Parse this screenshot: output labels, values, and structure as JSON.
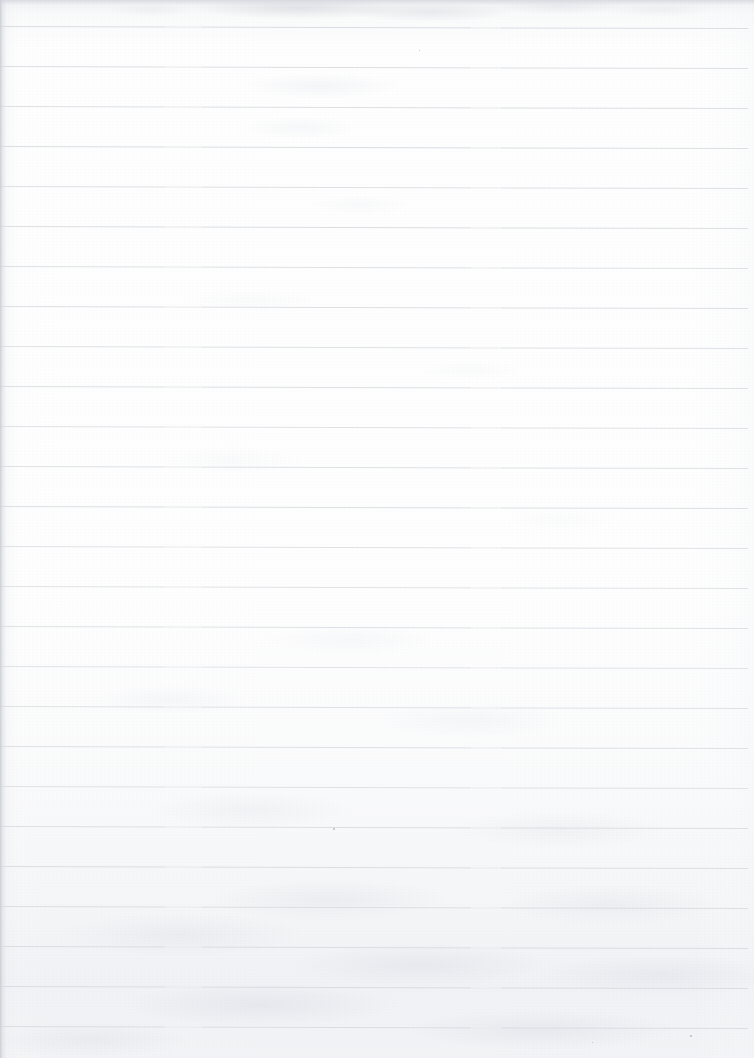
{
  "page": {
    "kind": "scanned-blank-lined-paper",
    "width_px": 754,
    "height_px": 1058,
    "orientation": "portrait",
    "content_text": "",
    "handwriting_present": "no",
    "printed_text_present": "no"
  },
  "paper": {
    "background_color": "#fefefe",
    "edge_shadow_color": "#c6c9d0",
    "texture_description": "faint grey mottling, strongest along the top edge and across the bottom third",
    "left_edge_band_width_px": 6
  },
  "ruling": {
    "line_color": "#d9dbe0",
    "line_thickness_px": 1,
    "line_spacing_px": 40,
    "first_line_y_px": 26,
    "line_count": 26,
    "tilt_degrees": 0.16,
    "left_inset_px": 0,
    "right_extent_px": 748,
    "margin_rule_present": "no",
    "lines_y": [
      26,
      66,
      106,
      146,
      186,
      226,
      266,
      306,
      346,
      386,
      426,
      466,
      506,
      546,
      586,
      626,
      666,
      706,
      746,
      786,
      826,
      866,
      906,
      946,
      986,
      1026
    ],
    "line_opacities": [
      0.95,
      0.9,
      0.88,
      0.92,
      0.86,
      0.9,
      0.84,
      0.88,
      0.82,
      0.86,
      0.8,
      0.84,
      0.88,
      0.8,
      0.78,
      0.82,
      0.76,
      0.8,
      0.84,
      0.78,
      0.86,
      0.9,
      0.88,
      0.92,
      0.94,
      0.9
    ]
  },
  "marks": {
    "specks": [
      {
        "x": 333,
        "y": 828,
        "size": 2
      },
      {
        "x": 690,
        "y": 1035,
        "size": 2
      },
      {
        "x": 592,
        "y": 1042,
        "size": 1
      },
      {
        "x": 419,
        "y": 50,
        "size": 1
      }
    ]
  }
}
